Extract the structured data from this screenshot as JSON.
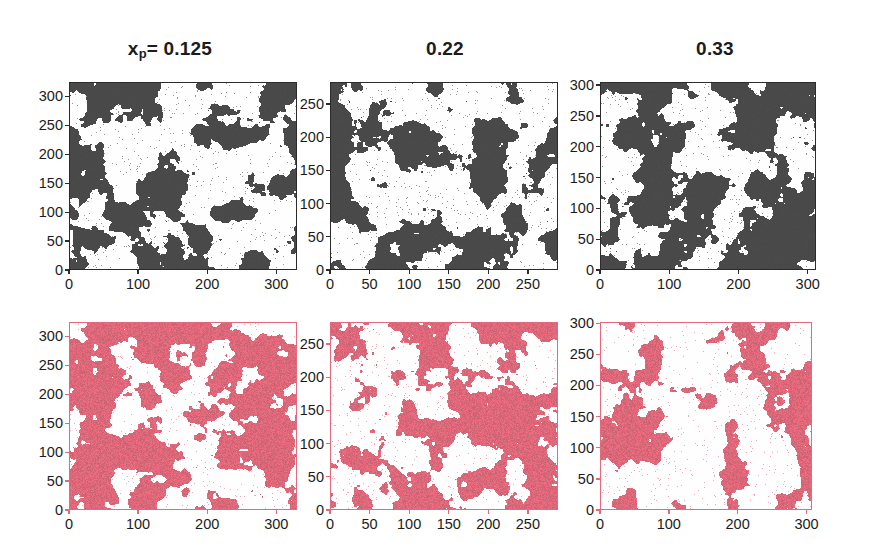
{
  "figure": {
    "background": "#ffffff",
    "rows": 2,
    "cols": 3,
    "columns": [
      {
        "title_prefix": "x",
        "title_sub": "p",
        "title_eq": "= 0.125",
        "value": 0.125
      },
      {
        "title_prefix": "",
        "title_sub": "",
        "title_eq": "0.22",
        "value": 0.22
      },
      {
        "title_prefix": "",
        "title_sub": "",
        "title_eq": "0.33",
        "value": 0.33
      }
    ]
  },
  "colors": {
    "dark_marker": "#4a4a4a",
    "pink_marker": "#ea6b7e",
    "axis": "#2b2b2b",
    "pink_axis": "#e4697c",
    "plot_background": "#fefefe",
    "text": "#1b1b1b"
  },
  "chart_data": {
    "type": "scatter",
    "grid": false,
    "legend": null,
    "xlabel": "",
    "ylabel": "",
    "panels": [
      {
        "id": "top-left",
        "row": 0,
        "col": 0,
        "title": "x_p = 0.125",
        "series_color": "#4a4a4a",
        "xlim": [
          0,
          330
        ],
        "ylim": [
          0,
          325
        ],
        "xticks": [
          0,
          100,
          200,
          300
        ],
        "yticks": [
          0,
          50,
          100,
          150,
          200,
          250,
          300
        ],
        "xticklabels": [
          "0",
          "100",
          "200",
          "300"
        ],
        "yticklabels": [
          "0",
          "50",
          "100",
          "150",
          "200",
          "250",
          "300"
        ],
        "point_count_estimate": 9000,
        "coverage_fraction": 0.42
      },
      {
        "id": "top-middle",
        "row": 0,
        "col": 1,
        "title": "0.22",
        "series_color": "#4a4a4a",
        "xlim": [
          0,
          288
        ],
        "ylim": [
          0,
          283
        ],
        "xticks": [
          0,
          50,
          100,
          150,
          200,
          250
        ],
        "yticks": [
          0,
          50,
          100,
          150,
          200,
          250
        ],
        "xticklabels": [
          "0",
          "50",
          "100",
          "150",
          "200",
          "250"
        ],
        "yticklabels": [
          "0",
          "50",
          "100",
          "150",
          "200",
          "250"
        ],
        "point_count_estimate": 8200,
        "coverage_fraction": 0.4
      },
      {
        "id": "top-right",
        "row": 0,
        "col": 2,
        "title": "0.33",
        "series_color": "#4a4a4a",
        "xlim": [
          0,
          312
        ],
        "ylim": [
          0,
          305
        ],
        "xticks": [
          0,
          100,
          200,
          300
        ],
        "yticks": [
          0,
          50,
          100,
          150,
          200,
          250,
          300
        ],
        "xticklabels": [
          "0",
          "100",
          "200",
          "300"
        ],
        "yticklabels": [
          "0",
          "50",
          "100",
          "150",
          "200",
          "250",
          "300"
        ],
        "point_count_estimate": 13000,
        "coverage_fraction": 0.58
      },
      {
        "id": "bottom-left",
        "row": 1,
        "col": 0,
        "title": "",
        "series_color": "#ea6b7e",
        "xlim": [
          0,
          330
        ],
        "ylim": [
          0,
          325
        ],
        "xticks": [
          0,
          100,
          200,
          300
        ],
        "yticks": [
          0,
          50,
          100,
          150,
          200,
          250,
          300
        ],
        "xticklabels": [
          "0",
          "100",
          "200",
          "300"
        ],
        "yticklabels": [
          "0",
          "50",
          "100",
          "150",
          "200",
          "250",
          "300"
        ],
        "point_count_estimate": 14000,
        "coverage_fraction": 0.62
      },
      {
        "id": "bottom-middle",
        "row": 1,
        "col": 1,
        "title": "",
        "series_color": "#ea6b7e",
        "xlim": [
          0,
          288
        ],
        "ylim": [
          0,
          283
        ],
        "xticks": [
          0,
          50,
          100,
          150,
          200,
          250
        ],
        "yticks": [
          0,
          50,
          100,
          150,
          200,
          250
        ],
        "xticklabels": [
          "0",
          "50",
          "100",
          "150",
          "200",
          "250"
        ],
        "yticklabels": [
          "0",
          "50",
          "100",
          "150",
          "200",
          "250"
        ],
        "point_count_estimate": 10500,
        "coverage_fraction": 0.48
      },
      {
        "id": "bottom-right",
        "row": 1,
        "col": 2,
        "title": "",
        "series_color": "#ea6b7e",
        "xlim": [
          0,
          308
        ],
        "ylim": [
          0,
          302
        ],
        "xticks": [
          0,
          100,
          200,
          300
        ],
        "yticks": [
          0,
          50,
          100,
          150,
          200,
          250,
          300
        ],
        "xticklabels": [
          "0",
          "100",
          "200",
          "300"
        ],
        "yticklabels": [
          "0",
          "50",
          "100",
          "150",
          "200",
          "250",
          "300"
        ],
        "point_count_estimate": 7000,
        "coverage_fraction": 0.33
      }
    ]
  }
}
